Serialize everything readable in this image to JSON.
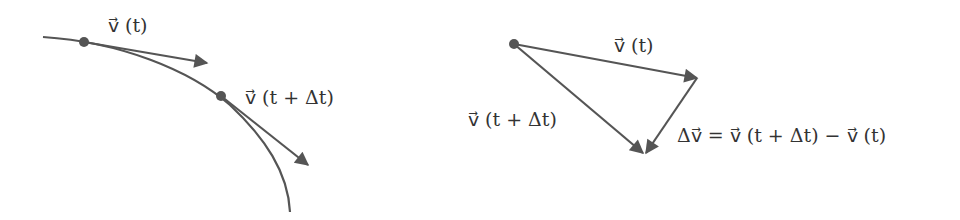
{
  "colors": {
    "stroke": "#555555",
    "text": "#333333",
    "background": "#ffffff"
  },
  "left_panel": {
    "title": "trajectory with velocity vectors",
    "label_v_t": "v⃗ (t)",
    "label_v_t_dt": "v⃗ (t + Δt)"
  },
  "right_panel": {
    "title": "vector subtraction triangle",
    "label_v_t": "v⃗ (t)",
    "label_v_t_dt": "v⃗ (t + Δt)",
    "label_delta_v": "Δv⃗ = v⃗ (t + Δt) − v⃗ (t)"
  }
}
